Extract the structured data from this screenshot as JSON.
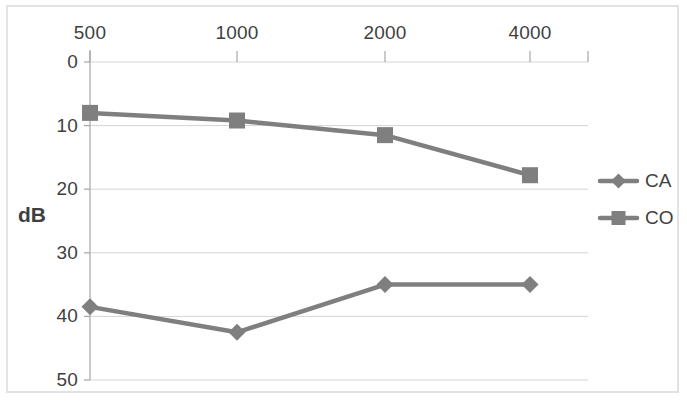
{
  "chart_data": {
    "type": "line",
    "title": "",
    "xlabel": "",
    "ylabel": "dB",
    "x": [
      500,
      1000,
      2000,
      4000
    ],
    "categories": [
      "500",
      "1000",
      "2000",
      "4000"
    ],
    "xtick_labels": [
      "500",
      "1000",
      "2000",
      "4000"
    ],
    "ytick_labels": [
      "0",
      "10",
      "20",
      "30",
      "40",
      "50"
    ],
    "yticks": [
      0,
      10,
      20,
      30,
      40,
      50
    ],
    "ylim": [
      0,
      50
    ],
    "y_axis_inverted": true,
    "x_axis_position": "top",
    "grid": "horizontal",
    "legend_position": "right",
    "series": [
      {
        "name": "CA",
        "marker": "diamond",
        "color": "#7f7f7f",
        "values": [
          38.5,
          42.5,
          35,
          35
        ]
      },
      {
        "name": "CO",
        "marker": "square",
        "color": "#7f7f7f",
        "values": [
          8,
          9.2,
          11.5,
          17.8
        ]
      }
    ]
  },
  "axis": {
    "y_title": "dB"
  },
  "legend": {
    "entries": [
      {
        "label": "CA",
        "marker": "diamond"
      },
      {
        "label": "CO",
        "marker": "square"
      }
    ]
  },
  "colors": {
    "series_line": "#7f7f7f",
    "gridline": "#d4d4d4",
    "axis_line": "#a6a6a6",
    "text": "#3f3f3f",
    "frame": "#e2e2e2",
    "background": "#ffffff"
  }
}
